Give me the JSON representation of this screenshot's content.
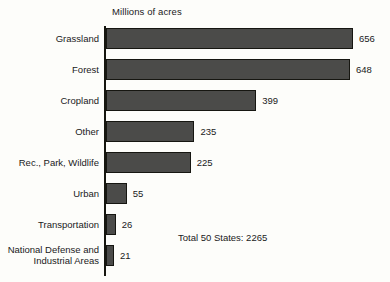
{
  "chart_data": {
    "type": "bar",
    "orientation": "horizontal",
    "title": "",
    "xlabel": "Millions of acres",
    "ylabel": "",
    "axis_title": "Millions of acres",
    "categories": [
      "Grassland",
      "Forest",
      "Cropland",
      "Other",
      "Rec., Park, Wildlife",
      "Urban",
      "Transportation",
      "National Defense and Industrial Areas"
    ],
    "values": [
      656,
      648,
      399,
      235,
      225,
      55,
      26,
      21
    ],
    "value_labels": [
      "656",
      "648",
      "399",
      "235",
      "225",
      "55",
      "26",
      "21"
    ],
    "xlim": [
      0,
      656
    ],
    "grid": false,
    "legend": null,
    "annotation": "Total 50 States: 2265",
    "bar_color": "#4b4b49",
    "bar_edge_color": "#161611",
    "background_color": "#fdfdfa",
    "text_color": "#1a1a1a"
  }
}
